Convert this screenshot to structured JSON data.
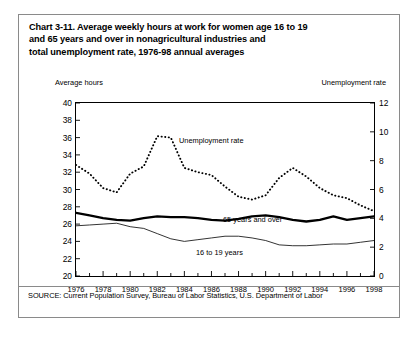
{
  "title": {
    "line1": "Chart 3-11. Average weekly hours at work for women age 16 to 19",
    "line2": "and 65 years and over in nonagricultural industries and",
    "line3": "total unemployment rate, 1976-98 annual averages"
  },
  "source": "SOURCE: Current Population Survey, Bureau of Labor Statistics, U.S. Department of Labor",
  "axis_caption_left": "Average hours",
  "axis_caption_right": "Unemployment rate",
  "chart_data": {
    "type": "line",
    "title": "Chart 3-11. Average weekly hours at work for women age 16 to 19 and 65 years and over in nonagricultural industries and total unemployment rate, 1976-98 annual averages",
    "xlabel": "",
    "ylabel": "Average hours",
    "y2label": "Unemployment rate",
    "xlim": [
      1976,
      1998
    ],
    "ylim": [
      20,
      40
    ],
    "y2lim": [
      0,
      12
    ],
    "yticks": [
      20,
      22,
      24,
      26,
      28,
      30,
      32,
      34,
      36,
      38,
      40
    ],
    "y2ticks": [
      0,
      2,
      4,
      6,
      8,
      10,
      12
    ],
    "xticks": [
      1976,
      1978,
      1980,
      1982,
      1984,
      1986,
      1988,
      1990,
      1992,
      1994,
      1996,
      1998
    ],
    "xtick_labels": [
      "1976",
      "1978",
      "1980",
      "1982",
      "1984",
      "1986",
      "1988",
      "1990",
      "1992",
      "1994",
      "1996",
      "1998"
    ],
    "minor_xticks_every": 1,
    "grid": false,
    "legend": "inline-annotations",
    "x": [
      1976,
      1977,
      1978,
      1979,
      1980,
      1981,
      1982,
      1983,
      1984,
      1985,
      1986,
      1987,
      1988,
      1989,
      1990,
      1991,
      1992,
      1993,
      1994,
      1995,
      1996,
      1997,
      1998
    ],
    "series": [
      {
        "name": "Unemployment rate",
        "axis": "right",
        "style": "dotted",
        "units": "percent",
        "values": [
          7.7,
          7.1,
          6.1,
          5.8,
          7.1,
          7.6,
          9.7,
          9.6,
          7.5,
          7.2,
          7.0,
          6.2,
          5.5,
          5.3,
          5.6,
          6.8,
          7.5,
          6.9,
          6.1,
          5.6,
          5.4,
          4.9,
          4.5
        ]
      },
      {
        "name": "65 years and over",
        "axis": "left",
        "style": "thick-solid",
        "units": "hours",
        "values": [
          27.3,
          27.0,
          26.7,
          26.5,
          26.4,
          26.7,
          26.9,
          26.8,
          26.8,
          26.7,
          26.5,
          26.4,
          26.6,
          26.9,
          27.0,
          26.8,
          26.5,
          26.3,
          26.5,
          26.9,
          26.5,
          26.7,
          26.9
        ]
      },
      {
        "name": "16 to 19 years",
        "axis": "left",
        "style": "thin-solid",
        "units": "hours",
        "values": [
          25.8,
          25.9,
          26.0,
          26.1,
          25.7,
          25.5,
          24.9,
          24.3,
          24.0,
          24.2,
          24.4,
          24.6,
          24.6,
          24.4,
          24.1,
          23.6,
          23.5,
          23.5,
          23.6,
          23.7,
          23.7,
          23.9,
          24.1
        ]
      }
    ],
    "annotations": [
      {
        "text": "Unemployment rate",
        "series": "Unemployment rate"
      },
      {
        "text": "65 years and over",
        "series": "65 years and over"
      },
      {
        "text": "16 to 19 years",
        "series": "16 to 19 years"
      }
    ]
  }
}
